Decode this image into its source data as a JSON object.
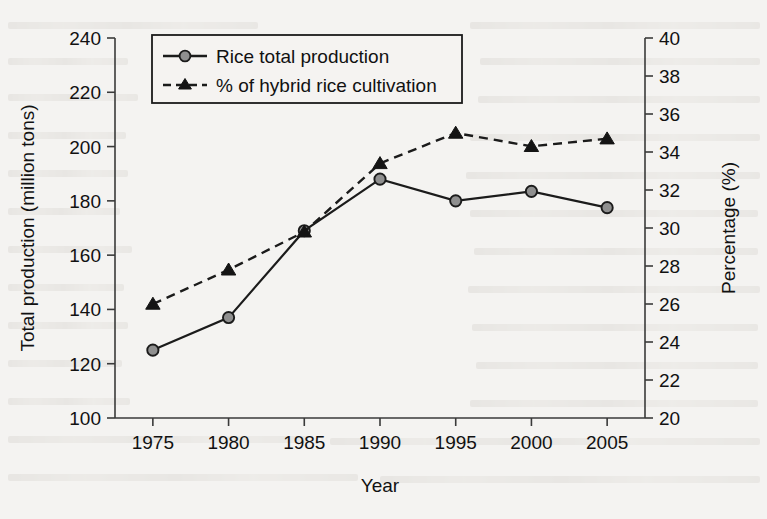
{
  "chart_data": {
    "type": "line",
    "title": "",
    "xlabel": "Year",
    "ylabel": "Total production (million tons)",
    "y2label": "Percentage (%)",
    "x": [
      1975,
      1980,
      1985,
      1990,
      1995,
      2000,
      2005
    ],
    "xticklabels": [
      "1975",
      "1980",
      "1985",
      "1990",
      "1995",
      "2000",
      "2005"
    ],
    "xlim": [
      1972.5,
      2007.5
    ],
    "ylim": [
      100,
      240
    ],
    "yticks": [
      100,
      120,
      140,
      160,
      180,
      200,
      220,
      240
    ],
    "yticklabels": [
      "100",
      "120",
      "140",
      "160",
      "180",
      "200",
      "220",
      "240"
    ],
    "y2lim": [
      20,
      40
    ],
    "y2ticks": [
      20,
      22,
      24,
      26,
      28,
      30,
      32,
      34,
      36,
      38,
      40
    ],
    "y2ticklabels": [
      "20",
      "22",
      "24",
      "26",
      "28",
      "30",
      "32",
      "34",
      "36",
      "38",
      "40"
    ],
    "grid": false,
    "legend_position": "upper left",
    "series": [
      {
        "name": "Rice total production",
        "axis": "left",
        "marker": "circle",
        "marker_fill": "#8f8f8f",
        "linestyle": "solid",
        "color": "#1b1b1b",
        "values": [
          125,
          137,
          169,
          188,
          180,
          183.5,
          177.5
        ]
      },
      {
        "name": "% of hybrid rice cultivation",
        "axis": "right",
        "marker": "triangle",
        "marker_fill": "#141414",
        "linestyle": "dashed",
        "color": "#1b1b1b",
        "values": [
          26.0,
          27.8,
          29.8,
          33.4,
          35.0,
          34.3,
          34.7
        ]
      }
    ]
  },
  "legend": {
    "items": [
      {
        "label": "Rice total production"
      },
      {
        "label": "% of hybrid rice cultivation"
      }
    ]
  }
}
